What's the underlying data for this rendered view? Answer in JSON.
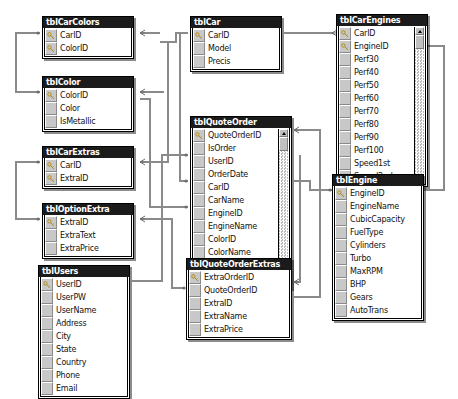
{
  "diagram": {
    "kind": "database-relationships",
    "background": "#ffffff",
    "line_color": "#8a8a8a",
    "title_bg": "#1b1b1b",
    "title_fg": "#ffffff",
    "gutter_color": "#c8c8c8"
  },
  "tables": [
    {
      "id": "tblCarColors",
      "name": "tblCarColors",
      "x": 42,
      "y": 16,
      "w": 92,
      "scrollbar": false,
      "fields": [
        {
          "name": "CarID",
          "key": true
        },
        {
          "name": "ColorID",
          "key": true
        }
      ]
    },
    {
      "id": "tblColor",
      "name": "tblColor",
      "x": 42,
      "y": 76,
      "w": 92,
      "scrollbar": false,
      "fields": [
        {
          "name": "ColorID",
          "key": true
        },
        {
          "name": "Color",
          "key": false
        },
        {
          "name": "IsMetallic",
          "key": false
        }
      ]
    },
    {
      "id": "tblCarExtras",
      "name": "tblCarExtras",
      "x": 42,
      "y": 146,
      "w": 92,
      "scrollbar": false,
      "fields": [
        {
          "name": "CarID",
          "key": true
        },
        {
          "name": "ExtraID",
          "key": true
        }
      ]
    },
    {
      "id": "tblOptionExtra",
      "name": "tblOptionExtra",
      "x": 42,
      "y": 203,
      "w": 92,
      "scrollbar": false,
      "fields": [
        {
          "name": "ExtraID",
          "key": true
        },
        {
          "name": "ExtraText",
          "key": false
        },
        {
          "name": "ExtraPrice",
          "key": false
        }
      ]
    },
    {
      "id": "tblUsers",
      "name": "tblUsers",
      "x": 38,
      "y": 265,
      "w": 92,
      "scrollbar": false,
      "fields": [
        {
          "name": "UserID",
          "key": true
        },
        {
          "name": "UserPW",
          "key": false
        },
        {
          "name": "UserName",
          "key": false
        },
        {
          "name": "Address",
          "key": false
        },
        {
          "name": "City",
          "key": false
        },
        {
          "name": "State",
          "key": false
        },
        {
          "name": "Country",
          "key": false
        },
        {
          "name": "Phone",
          "key": false
        },
        {
          "name": "Email",
          "key": false
        }
      ]
    },
    {
      "id": "tblCar",
      "name": "tblCar",
      "x": 190,
      "y": 16,
      "w": 92,
      "scrollbar": false,
      "fields": [
        {
          "name": "CarID",
          "key": true
        },
        {
          "name": "Model",
          "key": false
        },
        {
          "name": "Precis",
          "key": false
        }
      ]
    },
    {
      "id": "tblQuoteOrder",
      "name": "tblQuoteOrder",
      "x": 190,
      "y": 116,
      "w": 102,
      "scrollbar": true,
      "fields": [
        {
          "name": "QuoteOrderID",
          "key": true
        },
        {
          "name": "IsOrder",
          "key": false
        },
        {
          "name": "UserID",
          "key": false
        },
        {
          "name": "OrderDate",
          "key": false
        },
        {
          "name": "CarID",
          "key": false
        },
        {
          "name": "CarName",
          "key": false
        },
        {
          "name": "EngineID",
          "key": false
        },
        {
          "name": "EngineName",
          "key": false
        },
        {
          "name": "ColorID",
          "key": false
        },
        {
          "name": "ColorName",
          "key": false
        },
        {
          "name": "BasePrice",
          "key": false
        },
        {
          "name": "Interest",
          "key": false
        }
      ]
    },
    {
      "id": "tblQuoteOrderExtras",
      "name": "tblQuoteOrderExtras",
      "x": 186,
      "y": 258,
      "w": 106,
      "scrollbar": false,
      "fields": [
        {
          "name": "ExtraOrderID",
          "key": true
        },
        {
          "name": "QuoteOrderID",
          "key": false
        },
        {
          "name": "ExtraID",
          "key": false
        },
        {
          "name": "ExtraName",
          "key": false
        },
        {
          "name": "ExtraPrice",
          "key": false
        }
      ]
    },
    {
      "id": "tblCarEngines",
      "name": "tblCarEngines",
      "x": 336,
      "y": 14,
      "w": 92,
      "scrollbar": true,
      "fields": [
        {
          "name": "CarID",
          "key": true
        },
        {
          "name": "EngineID",
          "key": true
        },
        {
          "name": "Perf30",
          "key": false
        },
        {
          "name": "Perf40",
          "key": false
        },
        {
          "name": "Perf50",
          "key": false
        },
        {
          "name": "Perf60",
          "key": false
        },
        {
          "name": "Perf70",
          "key": false
        },
        {
          "name": "Perf80",
          "key": false
        },
        {
          "name": "Perf90",
          "key": false
        },
        {
          "name": "Perf100",
          "key": false
        },
        {
          "name": "Speed1st",
          "key": false
        },
        {
          "name": "Speed2nd",
          "key": false
        }
      ]
    },
    {
      "id": "tblEngine",
      "name": "tblEngine",
      "x": 332,
      "y": 174,
      "w": 92,
      "scrollbar": false,
      "fields": [
        {
          "name": "EngineID",
          "key": true
        },
        {
          "name": "EngineName",
          "key": false
        },
        {
          "name": "CubicCapacity",
          "key": false
        },
        {
          "name": "FuelType",
          "key": false
        },
        {
          "name": "Cylinders",
          "key": false
        },
        {
          "name": "Turbo",
          "key": false
        },
        {
          "name": "MaxRPM",
          "key": false
        },
        {
          "name": "BHP",
          "key": false
        },
        {
          "name": "Gears",
          "key": false
        },
        {
          "name": "AutoTrans",
          "key": false
        }
      ]
    }
  ],
  "relationships": [
    {
      "from": "tblCar.CarID",
      "to": "tblCarColors.CarID",
      "from_card": "1",
      "to_card": "many"
    },
    {
      "from": "tblColor.ColorID",
      "to": "tblCarColors.ColorID",
      "from_card": "1",
      "to_card": "many"
    },
    {
      "from": "tblCar.CarID",
      "to": "tblCarExtras.CarID",
      "from_card": "1",
      "to_card": "many"
    },
    {
      "from": "tblOptionExtra.ExtraID",
      "to": "tblCarExtras.ExtraID",
      "from_card": "1",
      "to_card": "many"
    },
    {
      "from": "tblCar.CarID",
      "to": "tblCarEngines.CarID",
      "from_card": "1",
      "to_card": "many"
    },
    {
      "from": "tblEngine.EngineID",
      "to": "tblCarEngines.EngineID",
      "from_card": "1",
      "to_card": "many"
    },
    {
      "from": "tblCar.CarID",
      "to": "tblQuoteOrder.CarID",
      "from_card": "1",
      "to_card": "many"
    },
    {
      "from": "tblEngine.EngineID",
      "to": "tblQuoteOrder.EngineID",
      "from_card": "1",
      "to_card": "many"
    },
    {
      "from": "tblColor.ColorID",
      "to": "tblQuoteOrder.ColorID",
      "from_card": "1",
      "to_card": "many"
    },
    {
      "from": "tblUsers.UserID",
      "to": "tblQuoteOrder.UserID",
      "from_card": "1",
      "to_card": "many"
    },
    {
      "from": "tblQuoteOrder.QuoteOrderID",
      "to": "tblQuoteOrderExtras.QuoteOrderID",
      "from_card": "1",
      "to_card": "many"
    },
    {
      "from": "tblOptionExtra.ExtraID",
      "to": "tblQuoteOrderExtras.ExtraID",
      "from_card": "1",
      "to_card": "many"
    }
  ]
}
